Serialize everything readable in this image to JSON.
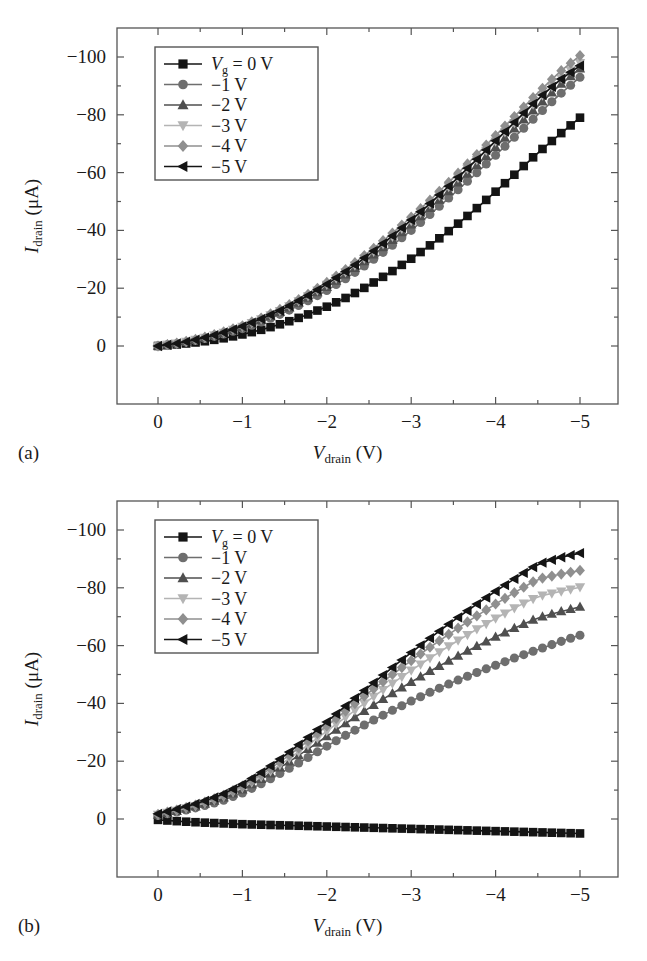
{
  "figure": {
    "panels": [
      {
        "id": "a",
        "panel_label": "(a)",
        "chart_index": 0
      },
      {
        "id": "b",
        "panel_label": "(b)",
        "chart_index": 1
      }
    ]
  },
  "axis": {
    "x_title_main": "V",
    "x_title_sub": "drain",
    "x_title_unit": " (V)",
    "y_title_main": "I",
    "y_title_sub": "drain",
    "y_title_unit": " (μA)",
    "x_ticks": [
      "0",
      "−1",
      "−2",
      "−3",
      "−4",
      "−5"
    ],
    "y_ticks": [
      "0",
      "−20",
      "−40",
      "−60",
      "−80",
      "−100"
    ]
  },
  "legend": {
    "entries": [
      {
        "label_main": "V",
        "label_sub": "g",
        "label_rest": " = 0 V",
        "marker": "square",
        "color": "#141414"
      },
      {
        "label_main": "",
        "label_sub": "",
        "label_rest": "−1 V",
        "marker": "circle",
        "color": "#6e6e6e"
      },
      {
        "label_main": "",
        "label_sub": "",
        "label_rest": "−2 V",
        "marker": "triangle-up",
        "color": "#4f4f4f"
      },
      {
        "label_main": "",
        "label_sub": "",
        "label_rest": "−3 V",
        "marker": "triangle-down",
        "color": "#b4b4b4"
      },
      {
        "label_main": "",
        "label_sub": "",
        "label_rest": "−4 V",
        "marker": "diamond",
        "color": "#8f8f8f"
      },
      {
        "label_main": "",
        "label_sub": "",
        "label_rest": "−5 V",
        "marker": "triangle-left",
        "color": "#141414"
      }
    ]
  },
  "chart_data": [
    {
      "type": "line",
      "title": "",
      "subtitle": "(a)",
      "xlabel": "V_drain (V)",
      "ylabel": "I_drain (μA)",
      "xlim": [
        0,
        -5
      ],
      "ylim": [
        0,
        -105
      ],
      "grid": false,
      "legend_position": "upper-left-inside",
      "x": [
        0,
        -0.25,
        -0.5,
        -0.75,
        -1,
        -1.25,
        -1.5,
        -1.75,
        -2,
        -2.25,
        -2.5,
        -2.75,
        -3,
        -3.25,
        -3.5,
        -3.75,
        -4,
        -4.25,
        -4.5,
        -4.75,
        -5
      ],
      "series": [
        {
          "name": "Vg = 0 V",
          "marker": "square",
          "color": "#141414",
          "values": [
            0,
            -0.6,
            -1.4,
            -2.5,
            -4.0,
            -5.8,
            -8.0,
            -10.6,
            -13.6,
            -17.0,
            -21.0,
            -25.4,
            -30.2,
            -35.4,
            -41.0,
            -47.0,
            -53.4,
            -60.0,
            -66.8,
            -73.0,
            -79.0
          ]
        },
        {
          "name": "−1 V",
          "marker": "circle",
          "color": "#6e6e6e",
          "values": [
            0,
            -0.9,
            -2.2,
            -3.9,
            -6.0,
            -8.6,
            -11.6,
            -15.2,
            -19.2,
            -23.8,
            -28.8,
            -34.2,
            -40.0,
            -46.2,
            -52.6,
            -59.2,
            -66.0,
            -73.0,
            -80.0,
            -86.8,
            -93.0
          ]
        },
        {
          "name": "−2 V",
          "marker": "triangle-up",
          "color": "#4f4f4f",
          "values": [
            0,
            -1.0,
            -2.4,
            -4.2,
            -6.4,
            -9.2,
            -12.4,
            -16.2,
            -20.4,
            -25.2,
            -30.4,
            -36.0,
            -42.0,
            -48.4,
            -55.0,
            -61.8,
            -68.8,
            -76.0,
            -83.0,
            -90.0,
            -96.0
          ]
        },
        {
          "name": "−3 V",
          "marker": "triangle-down",
          "color": "#b4b4b4",
          "values": [
            0,
            -1.0,
            -2.5,
            -4.4,
            -6.7,
            -9.6,
            -12.9,
            -16.8,
            -21.2,
            -26.1,
            -31.4,
            -37.2,
            -43.3,
            -49.8,
            -56.6,
            -63.6,
            -70.8,
            -78.0,
            -85.2,
            -92.0,
            -98.0
          ]
        },
        {
          "name": "−4 V",
          "marker": "diamond",
          "color": "#8f8f8f",
          "values": [
            0,
            -1.1,
            -2.6,
            -4.6,
            -7.0,
            -10.0,
            -13.4,
            -17.4,
            -22.0,
            -27.0,
            -32.5,
            -38.4,
            -44.6,
            -51.2,
            -58.2,
            -65.4,
            -72.8,
            -80.2,
            -87.6,
            -94.6,
            -100.5
          ]
        },
        {
          "name": "−5 V",
          "marker": "triangle-left",
          "color": "#141414",
          "values": [
            0,
            -1.0,
            -2.5,
            -4.4,
            -6.8,
            -9.7,
            -13.0,
            -17.0,
            -21.4,
            -26.3,
            -31.6,
            -37.4,
            -43.6,
            -50.0,
            -56.8,
            -63.8,
            -71.0,
            -78.2,
            -85.4,
            -91.8,
            -97.0
          ]
        }
      ]
    },
    {
      "type": "line",
      "title": "",
      "subtitle": "(b)",
      "xlabel": "V_drain (V)",
      "ylabel": "I_drain (μA)",
      "xlim": [
        0,
        -5
      ],
      "ylim": [
        0,
        -105
      ],
      "grid": false,
      "legend_position": "upper-left-inside",
      "x": [
        0,
        -0.25,
        -0.5,
        -0.75,
        -1,
        -1.25,
        -1.5,
        -1.75,
        -2,
        -2.25,
        -2.5,
        -2.75,
        -3,
        -3.25,
        -3.5,
        -3.75,
        -4,
        -4.25,
        -4.5,
        -4.75,
        -5
      ],
      "series": [
        {
          "name": "Vg = 0 V",
          "marker": "square",
          "color": "#141414",
          "values": [
            0.3,
            0.8,
            1.2,
            1.5,
            1.8,
            2.0,
            2.2,
            2.4,
            2.6,
            2.8,
            3.0,
            3.2,
            3.4,
            3.6,
            3.8,
            4.0,
            4.2,
            4.4,
            4.6,
            4.8,
            5.0
          ]
        },
        {
          "name": "−1 V",
          "marker": "circle",
          "color": "#6e6e6e",
          "values": [
            -1.2,
            -2.6,
            -4.2,
            -6.2,
            -9.0,
            -12.6,
            -16.6,
            -20.8,
            -25.2,
            -29.4,
            -33.4,
            -37.2,
            -40.8,
            -44.2,
            -47.4,
            -50.4,
            -53.2,
            -56.0,
            -58.6,
            -61.2,
            -63.6
          ]
        },
        {
          "name": "−2 V",
          "marker": "triangle-up",
          "color": "#4f4f4f",
          "values": [
            -1.4,
            -2.9,
            -4.7,
            -7.0,
            -10.2,
            -14.2,
            -18.8,
            -23.6,
            -28.6,
            -33.6,
            -38.4,
            -43.0,
            -47.4,
            -51.6,
            -55.6,
            -59.4,
            -63.0,
            -66.4,
            -69.6,
            -71.6,
            -73.4
          ]
        },
        {
          "name": "−3 V",
          "marker": "triangle-down",
          "color": "#b4b4b4",
          "values": [
            -1.5,
            -3.1,
            -5.0,
            -7.4,
            -10.8,
            -15.0,
            -19.8,
            -25.0,
            -30.4,
            -35.8,
            -41.2,
            -46.4,
            -51.4,
            -56.2,
            -60.8,
            -65.2,
            -69.4,
            -73.4,
            -77.0,
            -78.6,
            -80.2
          ]
        },
        {
          "name": "−4 V",
          "marker": "diamond",
          "color": "#8f8f8f",
          "values": [
            -1.6,
            -3.3,
            -5.3,
            -7.8,
            -11.4,
            -15.8,
            -20.9,
            -26.4,
            -32.2,
            -38.0,
            -43.8,
            -49.4,
            -54.8,
            -60.0,
            -65.0,
            -69.8,
            -74.4,
            -78.8,
            -83.0,
            -84.6,
            -86.0
          ]
        },
        {
          "name": "−5 V",
          "marker": "triangle-left",
          "color": "#141414",
          "values": [
            -1.8,
            -3.6,
            -5.7,
            -8.3,
            -12.0,
            -16.6,
            -21.9,
            -27.6,
            -33.6,
            -39.8,
            -45.8,
            -51.8,
            -57.6,
            -63.2,
            -68.6,
            -73.8,
            -78.8,
            -83.6,
            -88.2,
            -90.4,
            -92.0
          ]
        }
      ]
    }
  ]
}
